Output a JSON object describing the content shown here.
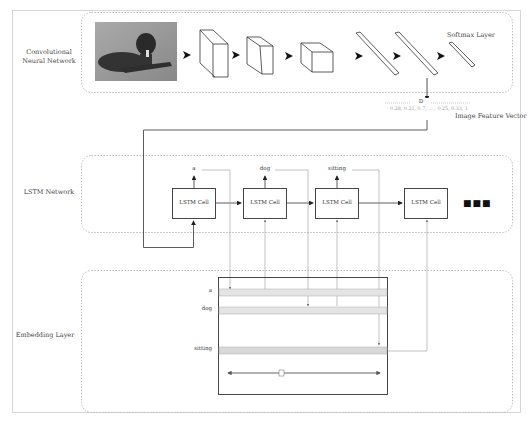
{
  "sections": {
    "cnn": {
      "label_line1": "Convolutional",
      "label_line2": "Neural Network",
      "softmax_label": "Softmax Layer"
    },
    "feature_vector": {
      "dim_label": "D",
      "values": "0.28, 0.21, 0.7, ... , 0.25, 0.33, 1",
      "label": "Image Feature Vector"
    },
    "lstm": {
      "label": "LSTM Network",
      "cells": [
        "LSTM Cell",
        "LSTM Cell",
        "LSTM Cell",
        "LSTM Cell"
      ],
      "outputs": [
        "a",
        "dog",
        "sitting"
      ],
      "continuation": "■■■"
    },
    "embedding": {
      "label": "Embedding Layer",
      "rows": [
        "a",
        "dog",
        "sitting"
      ],
      "dim_label": "D"
    }
  },
  "colors": {
    "line": "#333333",
    "dashed": "#bbbbbb",
    "gray_line": "#999999",
    "row_fill": "#e4e4e4"
  }
}
